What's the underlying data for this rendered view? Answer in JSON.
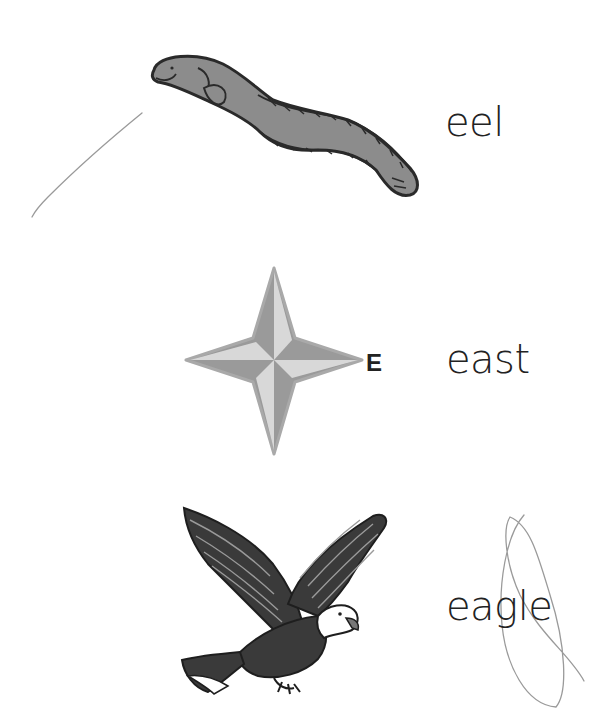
{
  "worksheet": {
    "items": [
      {
        "picture": "eel-illustration",
        "word": "eel"
      },
      {
        "picture": "compass-star-illustration",
        "compass_label": "E",
        "word": "east"
      },
      {
        "picture": "eagle-illustration",
        "word": "eagle"
      }
    ],
    "colors": {
      "fill_gray": "#8c8c8c",
      "light_gray": "#d6d6d6",
      "outline": "#2a2a2a",
      "pencil": "#9a9a9a",
      "text": "#222222"
    },
    "annotations": [
      {
        "type": "pencil-stroke",
        "near": "eel"
      },
      {
        "type": "pencil-loop",
        "near": "eagle"
      }
    ]
  }
}
